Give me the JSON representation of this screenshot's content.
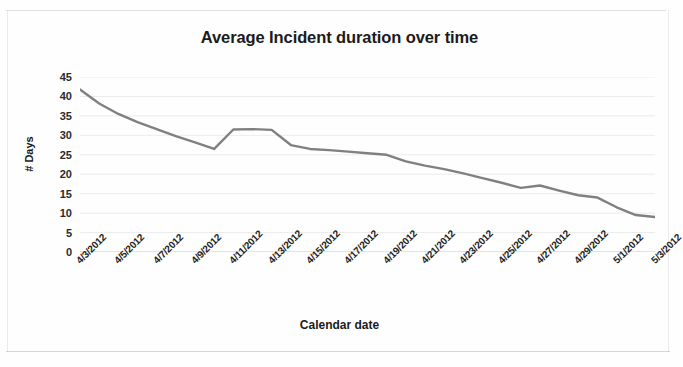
{
  "chart_data": {
    "type": "line",
    "title": "Average Incident duration over time",
    "xlabel": "Calendar date",
    "ylabel": "# Days",
    "grid": true,
    "legend": "none",
    "ylim": [
      0,
      45
    ],
    "ytick_step": 5,
    "yticks": [
      45,
      40,
      35,
      30,
      25,
      20,
      15,
      10,
      5,
      0
    ],
    "xtick_labels": [
      "4/3/2012",
      "4/5/2012",
      "4/7/2012",
      "4/9/2012",
      "4/11/2012",
      "4/13/2012",
      "4/15/2012",
      "4/17/2012",
      "4/19/2012",
      "4/21/2012",
      "4/23/2012",
      "4/25/2012",
      "4/27/2012",
      "4/29/2012",
      "5/1/2012",
      "5/3/2012"
    ],
    "xlim_labels": [
      "4/3/2012",
      "5/3/2012"
    ],
    "series": [
      {
        "name": "Average Incident duration",
        "color": "#808080",
        "x": [
          "4/3/2012",
          "4/4/2012",
          "4/5/2012",
          "4/6/2012",
          "4/7/2012",
          "4/8/2012",
          "4/9/2012",
          "4/10/2012",
          "4/11/2012",
          "4/12/2012",
          "4/13/2012",
          "4/14/2012",
          "4/15/2012",
          "4/16/2012",
          "4/17/2012",
          "4/18/2012",
          "4/19/2012",
          "4/20/2012",
          "4/21/2012",
          "4/22/2012",
          "4/23/2012",
          "4/24/2012",
          "4/25/2012",
          "4/26/2012",
          "4/27/2012",
          "4/28/2012",
          "4/29/2012",
          "4/30/2012",
          "5/1/2012",
          "5/2/2012",
          "5/3/2012"
        ],
        "values": [
          41.8,
          38.2,
          35.5,
          33.4,
          31.6,
          29.8,
          28.2,
          26.5,
          31.5,
          31.6,
          31.4,
          27.5,
          26.5,
          26.2,
          25.8,
          25.4,
          25.0,
          23.3,
          22.2,
          21.3,
          20.2,
          19.0,
          17.8,
          16.5,
          17.1,
          15.8,
          14.6,
          14.0,
          11.5,
          9.5,
          9.0
        ]
      }
    ]
  },
  "canvas": {
    "width": 679,
    "height": 367,
    "background": "#fefefe",
    "line_color": "#808080",
    "grid_color": "#e0e0e0",
    "text_color": "#1b1b1b"
  }
}
